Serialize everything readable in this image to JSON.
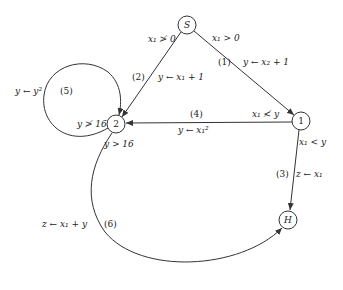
{
  "nodes": {
    "S": {
      "label": "S"
    },
    "n1": {
      "label": "1"
    },
    "n2": {
      "label": "2"
    },
    "H": {
      "label": "H"
    }
  },
  "edges": {
    "e1": {
      "id": "(1)",
      "condition": "x₁ > 0",
      "assignment": "y ← x₂ + 1"
    },
    "e2": {
      "id": "(2)",
      "condition": "x₁ ≯ 0",
      "assignment": "y ← x₁ + 1"
    },
    "e3": {
      "id": "(3)",
      "condition": "x₁ < y",
      "assignment": "z ← x₁"
    },
    "e4": {
      "id": "(4)",
      "condition": "x₁ ≮ y",
      "assignment": "y ← x₁²"
    },
    "e5": {
      "id": "(5)",
      "condition": "y ≯ 16",
      "assignment": "y ← y²"
    },
    "e6": {
      "id": "(6)",
      "condition": "y > 16",
      "assignment": "z ← x₁ + y"
    }
  }
}
